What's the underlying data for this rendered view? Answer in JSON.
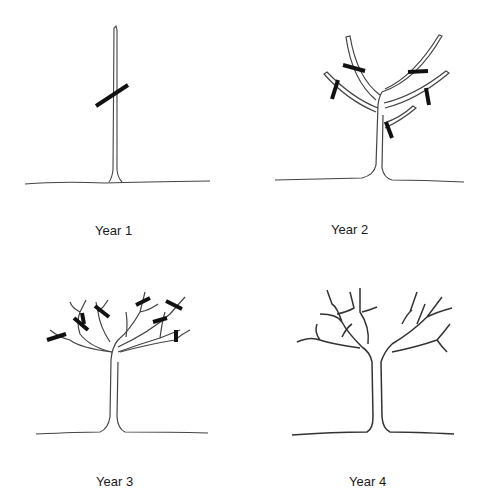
{
  "panels": [
    {
      "label": "Year 1",
      "cuts": 1,
      "description": "Single whip stem headed back"
    },
    {
      "label": "Year 2",
      "cuts": 6,
      "description": "Scaffold branches selected and headed"
    },
    {
      "label": "Year 3",
      "cuts": 9,
      "description": "Secondary branches headed"
    },
    {
      "label": "Year 4",
      "cuts": 0,
      "description": "Established open-center framework"
    }
  ],
  "colors": {
    "line": "#333333",
    "cut": "#111111",
    "background": "#ffffff"
  }
}
